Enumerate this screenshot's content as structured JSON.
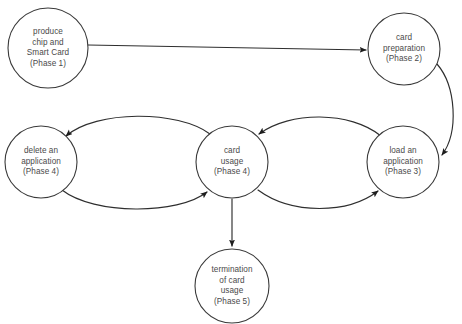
{
  "diagram": {
    "background_color": "#ffffff",
    "stroke_color": "#2e2e2e",
    "text_color": "#4a4a4a",
    "nodes": [
      {
        "id": "produce",
        "label": "produce\nchip and\nSmart Card\n(Phase 1)",
        "phase": "Phase 1",
        "cx": 48,
        "cy": 48,
        "rx": 40,
        "ry": 40
      },
      {
        "id": "preparation",
        "label": "card\npreparation\n(Phase 2)",
        "phase": "Phase 2",
        "cx": 404,
        "cy": 49,
        "rx": 36,
        "ry": 36
      },
      {
        "id": "delete",
        "label": "delete an\napplication\n(Phase 4)",
        "phase": "Phase 4",
        "cx": 41,
        "cy": 162,
        "rx": 36,
        "ry": 36
      },
      {
        "id": "usage",
        "label": "card\nusage\n(Phase 4)",
        "phase": "Phase 4",
        "cx": 232,
        "cy": 162,
        "rx": 36,
        "ry": 36
      },
      {
        "id": "load",
        "label": "load an\napplication\n(Phase 3)",
        "phase": "Phase 3",
        "cx": 403,
        "cy": 162,
        "rx": 36,
        "ry": 36
      },
      {
        "id": "termination",
        "label": "termination\nof card\nusage\n(Phase 5)",
        "phase": "Phase 5",
        "cx": 232,
        "cy": 286,
        "rx": 37,
        "ry": 37
      }
    ],
    "edges": [
      {
        "id": "produce-to-preparation",
        "from": "produce",
        "to": "preparation",
        "label": "",
        "path": "M 88 45 L 366 50"
      },
      {
        "id": "preparation-to-load",
        "from": "preparation",
        "to": "load",
        "label": "",
        "path": "M 437 64 C 456 86 459 132 442 155"
      },
      {
        "id": "usage-to-delete",
        "from": "usage",
        "to": "delete",
        "label": "",
        "path": "M 210 134 C 178 110 96 110 66 136"
      },
      {
        "id": "delete-to-usage",
        "from": "delete",
        "to": "usage",
        "label": "",
        "path": "M 62 190 C 94 215 178 215 207 192"
      },
      {
        "id": "load-to-usage",
        "from": "load",
        "to": "usage",
        "label": "",
        "path": "M 381 136 C 350 111 290 111 259 134"
      },
      {
        "id": "usage-to-load",
        "from": "usage",
        "to": "load",
        "label": "",
        "path": "M 258 190 C 292 215 348 214 378 191"
      },
      {
        "id": "usage-to-termination",
        "from": "usage",
        "to": "termination",
        "label": "",
        "path": "M 232 199 L 232 246"
      }
    ]
  }
}
